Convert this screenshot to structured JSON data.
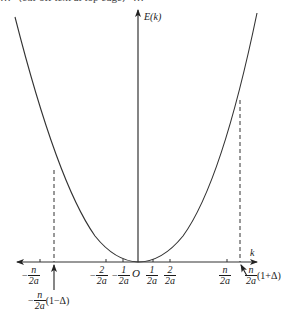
{
  "page_header_fragment": "…（cut-off text at top edge）…",
  "diagram": {
    "type": "energy-band parabola E(k) with k-axis",
    "y_axis_label": "E(k)",
    "x_axis_label": "k",
    "origin_label": "O",
    "colors": {
      "line": "#333333",
      "curve": "#333333",
      "background": "#ffffff"
    },
    "ticks": [
      {
        "sign": "−",
        "num": "n",
        "den": "2a",
        "x": 40
      },
      {
        "sign": "−",
        "num": "2",
        "den": "2a",
        "x": 106
      },
      {
        "sign": "−",
        "num": "1",
        "den": "2a",
        "x": 123
      },
      {
        "sign": "",
        "num": "1",
        "den": "2a",
        "x": 153
      },
      {
        "sign": "",
        "num": "2",
        "den": "2a",
        "x": 170
      },
      {
        "sign": "",
        "num": "n",
        "den": "2a",
        "x": 227
      }
    ],
    "annotations": [
      {
        "id": "left-boundary",
        "sign": "−",
        "num": "n",
        "den": "2a",
        "suffix": "(1−Δ)",
        "x": 54
      },
      {
        "id": "right-boundary",
        "sign": "",
        "num": "n",
        "den": "2a",
        "suffix": "(1+Δ)",
        "x": 240
      }
    ]
  }
}
